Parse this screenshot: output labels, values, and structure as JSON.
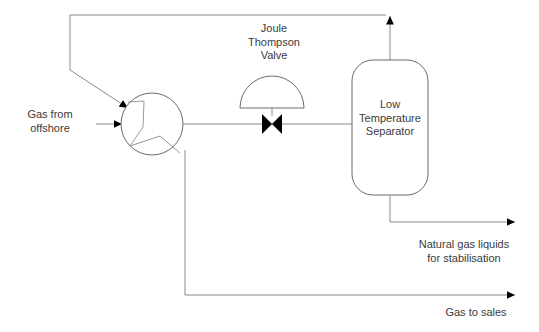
{
  "diagram": {
    "type": "process-flow-diagram",
    "colors": {
      "line": "#8a8a8a",
      "shape_stroke": "#6b6b6b",
      "arrow_fill": "#000000",
      "text": "#3a3a3a",
      "background": "#ffffff"
    },
    "labels": {
      "gas_from_offshore": "Gas from\noffshore",
      "jt_valve": "Joule\nThompson\nValve",
      "separator": "Low\nTemperature\nSeparator",
      "natural_gas_liquids": "Natural gas liquids\nfor stabilisation",
      "gas_to_sales": "Gas to sales"
    },
    "equipment": [
      {
        "id": "heat-exchanger",
        "name": "Heat exchanger",
        "symbol": "circle-with-zigzag",
        "cx": 152,
        "cy": 124,
        "r": 31
      },
      {
        "id": "jt-valve",
        "name": "Joule Thompson Valve",
        "symbol": "control-valve-bowtie-with-dome-actuator",
        "cx": 272,
        "cy": 124
      },
      {
        "id": "low-temperature-separator",
        "name": "Low Temperature Separator",
        "symbol": "rounded-vessel",
        "x": 352,
        "y": 60,
        "width": 76,
        "height": 135
      }
    ],
    "streams": [
      {
        "id": "feed-gas",
        "label": "Gas from offshore",
        "direction": "right"
      },
      {
        "id": "cooled-gas",
        "label": "",
        "direction": "right"
      },
      {
        "id": "separator-overhead-recycle",
        "label": "",
        "direction": "up-then-left"
      },
      {
        "id": "sales-gas",
        "label": "Gas to sales",
        "direction": "right"
      },
      {
        "id": "liquids",
        "label": "Natural gas liquids for stabilisation",
        "direction": "right"
      }
    ]
  }
}
